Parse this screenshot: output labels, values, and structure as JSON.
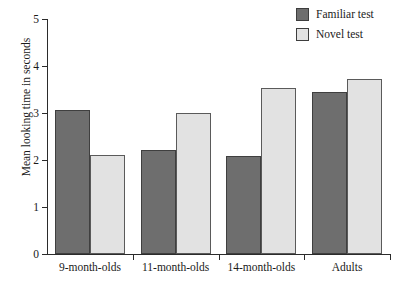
{
  "chart_data": {
    "type": "bar",
    "title": "",
    "xlabel": "",
    "ylabel": "Mean looking time in seconds",
    "categories": [
      "9-month-olds",
      "11-month-olds",
      "14-month-olds",
      "Adults"
    ],
    "series": [
      {
        "name": "Familiar test",
        "color": "#6e6e6e",
        "values": [
          3.06,
          2.22,
          2.09,
          3.45
        ]
      },
      {
        "name": "Novel test",
        "color": "#e2e2e2",
        "values": [
          2.1,
          3.01,
          3.53,
          3.73
        ]
      }
    ],
    "ylim": [
      0,
      5
    ],
    "yticks": [
      0,
      1,
      2,
      3,
      4,
      5
    ],
    "ytick_labels": [
      "0",
      "1",
      "2",
      "3",
      "4",
      "5"
    ],
    "grid": false,
    "legend_position": "top-right"
  },
  "legend": {
    "items": [
      {
        "label": "Familiar test",
        "swatch": "legend-swatch-familiar"
      },
      {
        "label": "Novel test",
        "swatch": "legend-swatch-novel"
      }
    ]
  }
}
